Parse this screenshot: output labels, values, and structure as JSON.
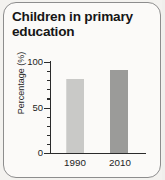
{
  "card": {
    "title": "Children in primary education"
  },
  "chart_data": {
    "type": "bar",
    "title": "Children in primary education",
    "categories": [
      "1990",
      "2010"
    ],
    "values": [
      81,
      91
    ],
    "series": [
      {
        "name": "Percentage",
        "values": [
          81,
          91
        ]
      }
    ],
    "xlabel": "",
    "ylabel": "Percentage (%)",
    "ylim": [
      0,
      100
    ],
    "y_ticks": [
      0,
      50,
      100
    ],
    "y_tick_labels": [
      "0",
      "50",
      "100"
    ],
    "y_minor_tick_count_per_interval": 4,
    "grid": false,
    "legend": false,
    "bar_colors": [
      "#c9c9c7",
      "#9b9b99"
    ]
  },
  "axis": {
    "y_title": "Percentage (%)",
    "tick_100": "100",
    "tick_50": "50",
    "tick_0": "0",
    "cat_1": "1990",
    "cat_2": "2010"
  }
}
